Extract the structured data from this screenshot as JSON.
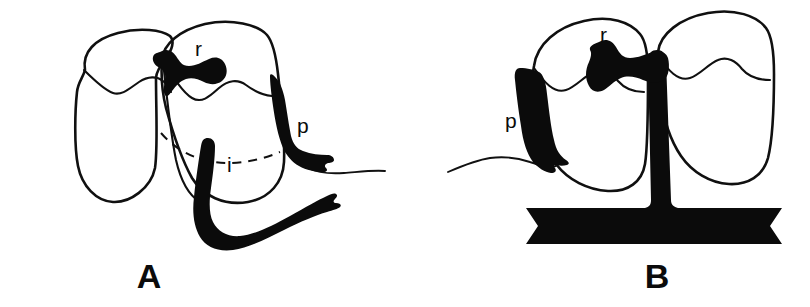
{
  "figure": {
    "caption_letters": [
      "A",
      "B"
    ],
    "background_color": "#ffffff",
    "ink_color": "#0b0b0b"
  },
  "panel_a": {
    "letter": "A",
    "labels": {
      "r": "r",
      "p": "p",
      "i": "i"
    },
    "parts": [
      {
        "key": "r",
        "name": "restoration-occlusal-inlay"
      },
      {
        "key": "p",
        "name": "proximal-band-restoration"
      },
      {
        "key": "i",
        "name": "interproximal-post-hook"
      }
    ],
    "teeth": [
      "left-molar-outline",
      "right-molar-outline"
    ],
    "gumline_style": "dashed"
  },
  "panel_b": {
    "letter": "B",
    "labels": {
      "r": "r",
      "p": "p"
    },
    "parts": [
      {
        "key": "r",
        "name": "restoration-occlusal-inlay"
      },
      {
        "key": "p",
        "name": "proximal-band-restoration"
      },
      {
        "key": "post",
        "name": "vertical-post"
      },
      {
        "key": "base",
        "name": "base-bar"
      }
    ],
    "teeth": [
      "left-molar-outline",
      "right-molar-outline"
    ],
    "gumline_style": "solid"
  }
}
